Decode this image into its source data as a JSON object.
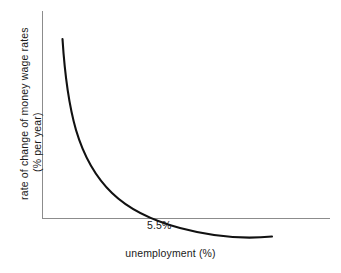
{
  "figure": {
    "background_color": "#ffffff",
    "axis_color": "#8c8c8c",
    "curve_color": "#111111",
    "text_color": "#1a1a1a"
  },
  "axes": {
    "y_label_line_1": "rate of change of money wage rates",
    "y_label_line_2": "(% per year)",
    "x_label": "unemployment (%)"
  },
  "annotations": {
    "nairu": "5.5%"
  },
  "chart_data": {
    "type": "line",
    "title": "",
    "subtitle": "",
    "xlabel": "unemployment (%)",
    "ylabel": "rate of change of money wage rates (% per year)",
    "grid": false,
    "legend": false,
    "legend_position": "none",
    "xlim": [
      0,
      10
    ],
    "ylim": [
      -3,
      12
    ],
    "zero_line_y": 0,
    "annotations": [
      {
        "text": "5.5%",
        "x": 5.5,
        "y": 0,
        "note": "unemployment rate at which wage inflation is zero; curve crosses horizontal axis"
      }
    ],
    "series": [
      {
        "name": "Phillips curve",
        "color": "#111111",
        "x": [
          0.7,
          0.8,
          0.95,
          1.1,
          1.3,
          1.55,
          1.85,
          2.2,
          2.6,
          3.05,
          3.55,
          4.1,
          4.7,
          5.5,
          6.3,
          7.1,
          7.9,
          8.7,
          9.4,
          10.0
        ],
        "y": [
          11.2,
          9.6,
          7.8,
          6.5,
          5.3,
          4.3,
          3.45,
          2.75,
          2.15,
          1.65,
          1.25,
          0.9,
          0.6,
          0.0,
          -0.45,
          -0.8,
          -1.05,
          -1.25,
          -1.4,
          -1.5
        ]
      }
    ]
  },
  "geometry": {
    "note": "pixel coordinates used by the SVG template",
    "y_axis": {
      "x": 42,
      "y_top": 11,
      "y_bottom": 218
    },
    "x_axis": {
      "y": 218,
      "x_left": 42,
      "x_right": 330
    },
    "curve_path": "M 62.5 39 C 64.6 72, 68.5 104, 76 130 C 84 157, 96.5 178, 112 193 C 129 209.5, 152 220.5, 180 228 C 210 236, 243 239.5, 272 236.5",
    "curve_width": 2.1,
    "axis_width": 1.0
  }
}
